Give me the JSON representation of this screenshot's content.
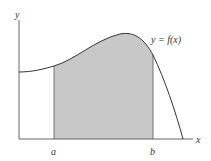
{
  "figure": {
    "type": "definite-integral-area-diagram",
    "axis_labels": {
      "x": "x",
      "y": "y"
    },
    "curve_label": "y = f(x)",
    "bounds": {
      "lower": "a",
      "upper": "b"
    },
    "colors": {
      "axis": "#555555",
      "curve": "#333333",
      "shade": "#c8c8c8",
      "background": "#ffffff"
    }
  }
}
